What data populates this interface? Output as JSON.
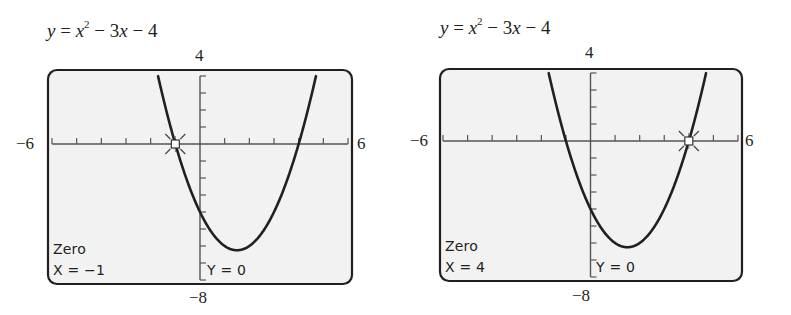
{
  "chart_data": [
    {
      "type": "line",
      "title": "y = x^2 - 3x - 4",
      "equation": {
        "lhs": "y",
        "rhs_parts": [
          "x",
          "2",
          " − 3",
          "x",
          " − 4"
        ]
      },
      "window": {
        "xmin": -6,
        "xmax": 6,
        "ymin": -8,
        "ymax": 4,
        "xscl": 1,
        "yscl": 1
      },
      "tick_labels": {
        "top": "4",
        "bottom": "−8",
        "left": "−6",
        "right": "6"
      },
      "function": {
        "a": 1,
        "b": -3,
        "c": -4
      },
      "x": [
        -1.7,
        -1,
        0,
        1,
        1.5,
        2,
        3,
        4,
        4.7
      ],
      "y": [
        3.99,
        0,
        -4,
        -6,
        -6.25,
        -6,
        -4,
        0,
        3.99
      ],
      "highlight_point": {
        "x": -1,
        "y": 0,
        "marker": "box-with-rays"
      },
      "screen_text": {
        "mode": "Zero",
        "x_readout": "X = −1",
        "y_readout": "Y = 0"
      },
      "grid": false,
      "legend": "none"
    },
    {
      "type": "line",
      "title": "y = x^2 - 3x - 4",
      "equation": {
        "lhs": "y",
        "rhs_parts": [
          "x",
          "2",
          " − 3",
          "x",
          " − 4"
        ]
      },
      "window": {
        "xmin": -6,
        "xmax": 6,
        "ymin": -8,
        "ymax": 4,
        "xscl": 1,
        "yscl": 1
      },
      "tick_labels": {
        "top": "4",
        "bottom": "−8",
        "left": "−6",
        "right": "6"
      },
      "function": {
        "a": 1,
        "b": -3,
        "c": -4
      },
      "x": [
        -1.7,
        -1,
        0,
        1,
        1.5,
        2,
        3,
        4,
        4.7
      ],
      "y": [
        3.99,
        0,
        -4,
        -6,
        -6.25,
        -6,
        -4,
        0,
        3.99
      ],
      "highlight_point": {
        "x": 4,
        "y": 0,
        "marker": "box-with-rays"
      },
      "screen_text": {
        "mode": "Zero",
        "x_readout": "X = 4",
        "y_readout": "Y = 0"
      },
      "grid": false,
      "legend": "none"
    }
  ],
  "colors": {
    "ink": "#231f20",
    "screen_bg": "#f2f2f2",
    "axis": "#555555"
  }
}
